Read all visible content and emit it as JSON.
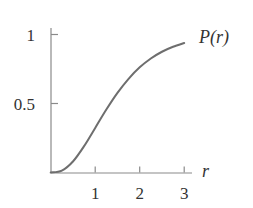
{
  "chart_data": {
    "type": "line",
    "title": "",
    "xlabel": "r",
    "ylabel": "",
    "series": [
      {
        "name": "P(r)",
        "x": [
          0,
          0.25,
          0.5,
          0.75,
          1.0,
          1.25,
          1.5,
          1.75,
          2.0,
          2.25,
          2.5,
          2.75,
          3.0
        ],
        "values": [
          0,
          0.014,
          0.08,
          0.191,
          0.323,
          0.456,
          0.577,
          0.679,
          0.762,
          0.826,
          0.875,
          0.911,
          0.938
        ]
      }
    ],
    "curve_label": "P(r)",
    "xticks": [
      1,
      2,
      3
    ],
    "xtick_labels": [
      "1",
      "2",
      "3"
    ],
    "yticks": [
      0.5,
      1
    ],
    "ytick_labels": [
      "0.5",
      "1"
    ],
    "xlim": [
      0,
      3.2
    ],
    "ylim": [
      0,
      1.0
    ],
    "grid": false,
    "legend": "none",
    "colors": {
      "curve": "#6e6e6e",
      "axes": "#8a8a8a",
      "text": "#333333"
    }
  }
}
